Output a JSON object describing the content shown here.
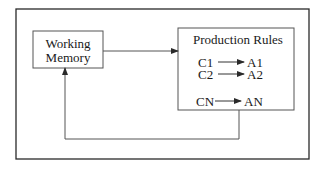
{
  "diagram": {
    "type": "production-system",
    "colors": {
      "line": "#2a2a2a",
      "background": "#ffffff",
      "text": "#1a1a1a"
    },
    "working_memory": {
      "line1": "Working",
      "line2": "Memory"
    },
    "production_rules": {
      "title": "Production Rules",
      "rules": [
        {
          "condition": "C1",
          "action": "A1"
        },
        {
          "condition": "C2",
          "action": "A2"
        },
        {
          "condition": "CN",
          "action": "AN"
        }
      ]
    },
    "edges": [
      {
        "from": "Working Memory",
        "to": "Production Rules",
        "kind": "arrow"
      },
      {
        "from": "Production Rules",
        "to": "Working Memory",
        "kind": "feedback-arrow"
      }
    ]
  }
}
